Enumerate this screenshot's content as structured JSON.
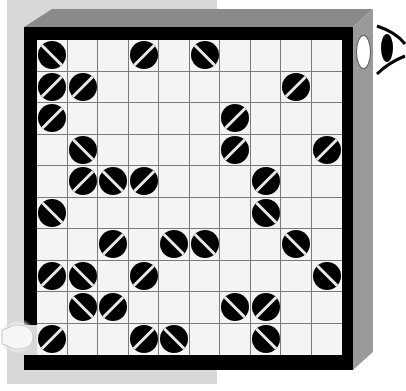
{
  "game": {
    "type": "laser-mirror-puzzle",
    "rows": 10,
    "cols": 10,
    "colors": {
      "frame": "#000000",
      "bevel": "#8a8a8a",
      "panel": "#d8d8d8",
      "grid_bg": "#f4f4f4",
      "mirror": "#000000",
      "mirror_line": "#e8e8e8"
    },
    "mirrors": [
      {
        "row": 0,
        "col": 0,
        "dir": "\\"
      },
      {
        "row": 0,
        "col": 3,
        "dir": "/"
      },
      {
        "row": 0,
        "col": 5,
        "dir": "\\"
      },
      {
        "row": 1,
        "col": 0,
        "dir": "/"
      },
      {
        "row": 1,
        "col": 1,
        "dir": "/"
      },
      {
        "row": 1,
        "col": 8,
        "dir": "/"
      },
      {
        "row": 2,
        "col": 0,
        "dir": "/"
      },
      {
        "row": 2,
        "col": 6,
        "dir": "/"
      },
      {
        "row": 3,
        "col": 1,
        "dir": "\\"
      },
      {
        "row": 3,
        "col": 6,
        "dir": "/"
      },
      {
        "row": 3,
        "col": 9,
        "dir": "/"
      },
      {
        "row": 4,
        "col": 1,
        "dir": "/"
      },
      {
        "row": 4,
        "col": 2,
        "dir": "\\"
      },
      {
        "row": 4,
        "col": 3,
        "dir": "/"
      },
      {
        "row": 4,
        "col": 7,
        "dir": "/"
      },
      {
        "row": 5,
        "col": 0,
        "dir": "\\"
      },
      {
        "row": 5,
        "col": 7,
        "dir": "\\"
      },
      {
        "row": 6,
        "col": 2,
        "dir": "/"
      },
      {
        "row": 6,
        "col": 4,
        "dir": "\\"
      },
      {
        "row": 6,
        "col": 5,
        "dir": "\\"
      },
      {
        "row": 6,
        "col": 8,
        "dir": "\\"
      },
      {
        "row": 7,
        "col": 0,
        "dir": "/"
      },
      {
        "row": 7,
        "col": 1,
        "dir": "\\"
      },
      {
        "row": 7,
        "col": 3,
        "dir": "/"
      },
      {
        "row": 7,
        "col": 9,
        "dir": "\\"
      },
      {
        "row": 8,
        "col": 1,
        "dir": "\\"
      },
      {
        "row": 8,
        "col": 2,
        "dir": "/"
      },
      {
        "row": 8,
        "col": 6,
        "dir": "\\"
      },
      {
        "row": 8,
        "col": 7,
        "dir": "/"
      },
      {
        "row": 9,
        "col": 0,
        "dir": "/"
      },
      {
        "row": 9,
        "col": 3,
        "dir": "/"
      },
      {
        "row": 9,
        "col": 4,
        "dir": "\\"
      },
      {
        "row": 9,
        "col": 7,
        "dir": "\\"
      }
    ],
    "icons": {
      "light_source": "light-source-icon",
      "viewer": "eye-icon",
      "exit_hole": "exit-hole"
    },
    "light_source": {
      "side": "left",
      "row": 9
    },
    "exit": {
      "side": "right",
      "row": 0
    }
  }
}
